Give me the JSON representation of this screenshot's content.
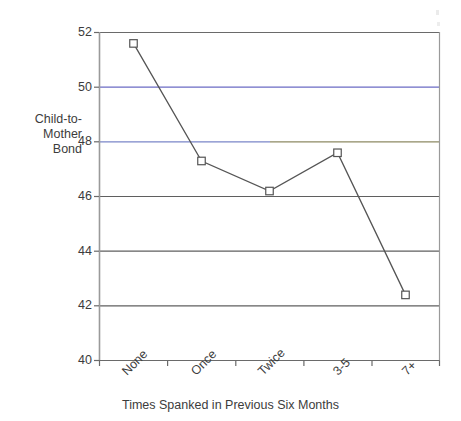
{
  "chart_data": {
    "type": "line",
    "title": "",
    "subtitle": "",
    "xlabel": "Times Spanked in Previous Six Months",
    "ylabel": "Child-to-\nMother\nBond",
    "categories": [
      "None",
      "Once",
      "Twice",
      "3-5",
      "7+"
    ],
    "values": [
      51.6,
      47.3,
      46.2,
      47.6,
      42.4
    ],
    "series": [
      {
        "name": "Child-to-Mother Bond",
        "values": [
          51.6,
          47.3,
          46.2,
          47.6,
          42.4
        ]
      }
    ],
    "ylim": [
      40,
      52
    ],
    "yticks": [
      40,
      42,
      44,
      46,
      48,
      50,
      52
    ],
    "ytick_labels": [
      "40",
      "42",
      "44",
      "46",
      "48",
      "50",
      "52"
    ],
    "xtick_labels": [
      "None",
      "Once",
      "Twice",
      "3-5",
      "7+"
    ],
    "xtick_rotation": -45,
    "grid": true,
    "grid_orientation": "horizontal",
    "legend": false,
    "legend_position": "none",
    "marker": "open-square",
    "line_color": "#555555",
    "marker_edge_color": "#555555",
    "marker_face_color": "#ffffff",
    "gridline_colors": {
      "default": "#555555",
      "50": "#6b6bc4",
      "48": "#7a86c8"
    },
    "axis_color": "#9a9a9a",
    "background": "#ffffff"
  }
}
